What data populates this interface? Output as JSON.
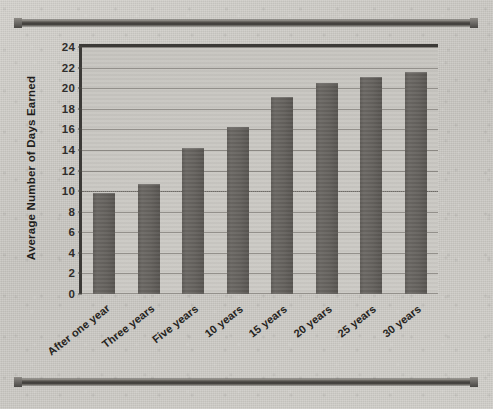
{
  "chart_data": {
    "type": "bar",
    "title": "",
    "xlabel": "",
    "ylabel": "Average Number of Days Earned",
    "categories": [
      "After one year",
      "Three years",
      "Five years",
      "10 years",
      "15 years",
      "20 years",
      "25 years",
      "30 years"
    ],
    "values": [
      9.8,
      10.7,
      14.2,
      16.2,
      19.1,
      20.5,
      21.1,
      21.6
    ],
    "ylim": [
      0,
      24
    ],
    "ytick_values": [
      0,
      2,
      4,
      6,
      8,
      10,
      12,
      14,
      16,
      18,
      20,
      22,
      24
    ],
    "ytick_labels": [
      "0",
      "2",
      "4",
      "6",
      "8",
      "10",
      "12",
      "14",
      "16",
      "18",
      "20",
      "22",
      "24"
    ],
    "grid": true,
    "legend": "none",
    "reference_line": 10,
    "bar_color": "#615e5a",
    "plot_background": "#c8c6c1",
    "axis_color": "#3c3a37",
    "gridline_color": "#8d8a85"
  },
  "figure": {
    "frame_color": "#4a4845",
    "page_background": "#cfcdc8"
  }
}
